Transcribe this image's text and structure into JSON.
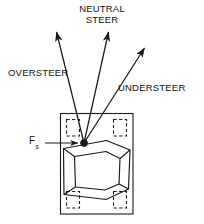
{
  "figure": {
    "type": "engineering-diagram",
    "background_color": "#ffffff",
    "line_color": "#1a1a1a",
    "labels": {
      "neutral_steer_line1": "NEUTRAL",
      "neutral_steer_line2": "STEER",
      "oversteer": "OVERSTEER",
      "understeer": "UNDERSTEER",
      "side_force_symbol": "F",
      "side_force_subscript": "s"
    },
    "arrows": [
      {
        "name": "oversteer-arrow",
        "label": "OVERSTEER",
        "from_x": 84,
        "from_y": 143,
        "to_x": 56,
        "to_y": 31
      },
      {
        "name": "neutral-steer-arrow",
        "label": "NEUTRAL STEER",
        "from_x": 84,
        "from_y": 143,
        "to_x": 109,
        "to_y": 31
      },
      {
        "name": "understeer-arrow",
        "label": "UNDERSTEER",
        "from_x": 84,
        "from_y": 143,
        "to_x": 145,
        "to_y": 47
      },
      {
        "name": "side-force-arrow",
        "label": "Fs",
        "from_x": 46,
        "from_y": 143,
        "to_x": 79,
        "to_y": 143
      }
    ],
    "vehicle": {
      "outline": {
        "x": 60,
        "y": 113,
        "width": 73,
        "height": 101
      },
      "center_of_gravity": {
        "x": 84,
        "y": 143,
        "radius": 3.4
      },
      "wheels": [
        {
          "name": "wheel-front-left",
          "x": 66,
          "y": 119,
          "width": 14,
          "height": 17
        },
        {
          "name": "wheel-front-right",
          "x": 113,
          "y": 119,
          "width": 14,
          "height": 17
        },
        {
          "name": "wheel-rear-left",
          "x": 66,
          "y": 191,
          "width": 14,
          "height": 17
        },
        {
          "name": "wheel-rear-right",
          "x": 113,
          "y": 191,
          "width": 14,
          "height": 17
        }
      ],
      "body_outer": [
        [
          63,
          148
        ],
        [
          107,
          140
        ],
        [
          130,
          150
        ],
        [
          128,
          189
        ],
        [
          106,
          199
        ],
        [
          64,
          194
        ]
      ],
      "body_inner": [
        [
          74,
          156
        ],
        [
          106,
          151
        ],
        [
          120,
          158
        ],
        [
          119,
          184
        ],
        [
          105,
          190
        ],
        [
          75,
          187
        ]
      ]
    }
  }
}
